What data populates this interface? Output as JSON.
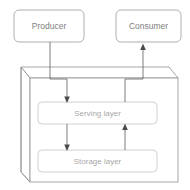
{
  "diagram": {
    "nodes": {
      "producer": {
        "label": "Producer"
      },
      "consumer": {
        "label": "Consumer"
      },
      "serving_layer": {
        "label": "Serving layer"
      },
      "storage_layer": {
        "label": "Storage layer"
      }
    },
    "connectors": [
      {
        "name": "producer-to-serving",
        "from": "Producer",
        "to": "Serving layer",
        "direction": "down"
      },
      {
        "name": "serving-to-consumer",
        "from": "Serving layer",
        "to": "Consumer",
        "direction": "up"
      },
      {
        "name": "serving-to-storage",
        "from": "Serving layer",
        "to": "Storage layer",
        "direction": "down"
      },
      {
        "name": "storage-to-serving",
        "from": "Storage layer",
        "to": "Serving layer",
        "direction": "up"
      }
    ],
    "colors": {
      "background": "#ffffff",
      "node_stroke": "#9a9a9a",
      "node_text": "#808080",
      "layer_stroke": "#c4c4c4",
      "layer_text": "#a8a8a8",
      "container_stroke": "#8f8f8f",
      "connector": "#6e6e6e",
      "arrowhead": "#4a4a4a"
    }
  }
}
